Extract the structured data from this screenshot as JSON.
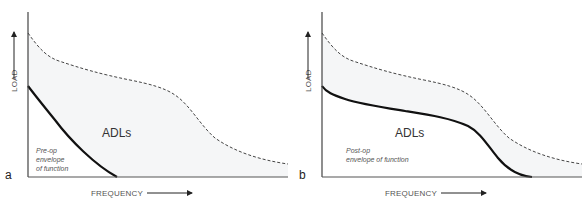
{
  "panels": [
    {
      "id": "a",
      "letter": "a",
      "y_axis_label": "LOAD",
      "x_axis_label": "FREQUENCY",
      "region_label": "ADLs",
      "envelope_label_lines": [
        "Pre-op",
        "envelope",
        "of function"
      ],
      "curves": {
        "adl_upper_boundary": "dashed",
        "envelope_of_function": "solid, steep decline reaching zero load at low frequency"
      }
    },
    {
      "id": "b",
      "letter": "b",
      "y_axis_label": "LOAD",
      "x_axis_label": "FREQUENCY",
      "region_label": "ADLs",
      "envelope_label_lines": [
        "Post-op",
        "envelope of function"
      ],
      "curves": {
        "adl_upper_boundary": "dashed",
        "envelope_of_function": "solid, plateau then decline reaching zero load at higher frequency"
      }
    }
  ],
  "colors": {
    "axis": "#444444",
    "solid_curve": "#111111",
    "dashed_curve": "#444444",
    "adl_fill": "#f5f6f7",
    "text": "#555555"
  }
}
